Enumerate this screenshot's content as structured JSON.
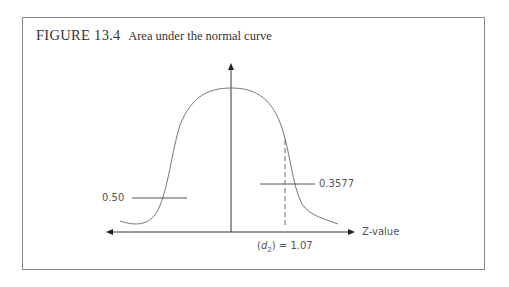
{
  "figure": {
    "number": "FIGURE 13.4",
    "caption": "Area under the normal curve"
  },
  "labels": {
    "left_area": "0.50",
    "right_area": "0.3577",
    "z_marker": "(d2) = 1.07",
    "z_marker_var": "d",
    "z_marker_sub": "2",
    "z_marker_value": "= 1.07",
    "x_axis": "Z-value"
  },
  "colors": {
    "curve": "#777777",
    "axis": "#333333",
    "border": "#8a8a8a",
    "text": "#555555"
  }
}
